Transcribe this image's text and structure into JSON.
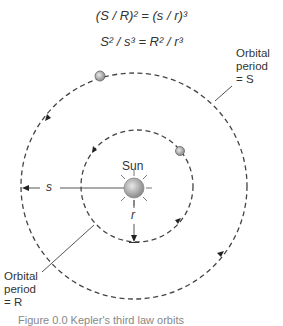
{
  "equations": {
    "line1": "(S / R)² = (s / r)³",
    "line2": "S² / s³ = R² / r³"
  },
  "labels": {
    "sun": "Sun",
    "s": "s",
    "r": "r",
    "outer_period_line1": "Orbital",
    "outer_period_line2": "period",
    "outer_period_line3": "= S",
    "inner_period_line1": "Orbital",
    "inner_period_line2": "period",
    "inner_period_line3": "= R"
  },
  "caption": "Figure 0.0   Kepler's third law orbits",
  "colors": {
    "orbit": "#444444",
    "planet": "#9a9a9a",
    "sun": "#a8a8a8",
    "text": "#333333"
  }
}
